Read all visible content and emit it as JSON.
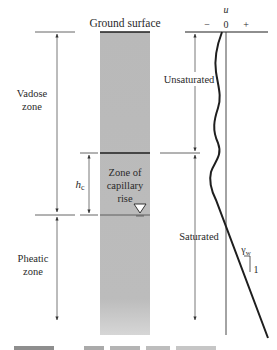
{
  "figure": {
    "ground_surface_label": "Ground surface",
    "left_labels": {
      "vadose_line1": "Vadose",
      "vadose_line2": "zone",
      "pheatic_line1": "Pheatic",
      "pheatic_line2": "zone",
      "hc_symbol": "h",
      "hc_subscript": "c"
    },
    "column_labels": {
      "capillary_line1": "Zone of",
      "capillary_line2": "capillary",
      "capillary_line3": "rise"
    },
    "graph": {
      "axis_variable": "u",
      "minus_sign": "−",
      "zero": "0",
      "plus_sign": "+",
      "unsaturated_label": "Unsaturated",
      "saturated_label": "Saturated",
      "slope_label": "γ",
      "slope_subscript": "w",
      "slope_run": "1"
    },
    "caption_fragment": "FIGURE 9.3?  ..."
  },
  "colors": {
    "soil_column": "#b9b9b9",
    "line": "#1e1e1e",
    "thin_line": "#555555"
  }
}
